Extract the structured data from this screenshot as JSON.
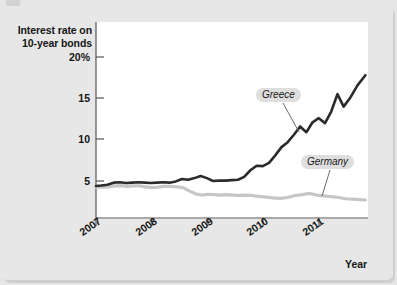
{
  "figure": {
    "background_color": "#e7e7e7",
    "plot_background_color": "#ffffff"
  },
  "axis": {
    "y_title_line1": "Interest rate on",
    "y_title_line2": "10-year bonds",
    "x_title": "Year",
    "y_ticks": [
      "20%",
      "15",
      "10",
      "5"
    ],
    "x_ticks": [
      "2007",
      "2008",
      "2009",
      "2010",
      "2011"
    ]
  },
  "labels": {
    "greece": "Greece",
    "germany": "Germany"
  },
  "chart_data": {
    "type": "line",
    "title": "",
    "subtitle": "",
    "xlabel": "Year",
    "ylabel": "Interest rate on 10-year bonds",
    "xlim": [
      2007.0,
      2012.25
    ],
    "ylim": [
      0,
      21.5
    ],
    "ytick_values": [
      20,
      15,
      10,
      5
    ],
    "ytick_labels": [
      "20%",
      "15",
      "10",
      "5"
    ],
    "xtick_values": [
      2007,
      2008,
      2009,
      2010,
      2011
    ],
    "xtick_labels": [
      "2007",
      "2008",
      "2009",
      "2010",
      "2011"
    ],
    "grid": false,
    "legend_position": "inline-annotation",
    "colors": {
      "greece": "#2b2b2b",
      "germany": "#c6c6c6"
    },
    "annotations": [
      {
        "text": "Greece",
        "points_to_series": "Greece",
        "x": 2010.55,
        "y": 11.4
      },
      {
        "text": "Germany",
        "points_to_series": "Germany",
        "x": 2011.45,
        "y": 7.4
      }
    ],
    "series": [
      {
        "name": "Greece",
        "color": "#2b2b2b",
        "x": [
          2007.0,
          2007.1,
          2007.22,
          2007.34,
          2007.46,
          2007.58,
          2007.7,
          2007.82,
          2007.94,
          2008.06,
          2008.18,
          2008.3,
          2008.42,
          2008.54,
          2008.66,
          2008.78,
          2008.9,
          2009.02,
          2009.14,
          2009.26,
          2009.38,
          2009.5,
          2009.62,
          2009.74,
          2009.86,
          2009.98,
          2010.1,
          2010.22,
          2010.34,
          2010.46,
          2010.58,
          2010.7,
          2010.82,
          2010.94,
          2011.06,
          2011.18,
          2011.3,
          2011.42,
          2011.54,
          2011.66,
          2011.78,
          2011.9,
          2012.05,
          2012.2
        ],
        "y": [
          4.4,
          4.45,
          4.55,
          4.8,
          4.85,
          4.75,
          4.8,
          4.85,
          4.8,
          4.75,
          4.8,
          4.85,
          4.8,
          4.95,
          5.25,
          5.15,
          5.35,
          5.6,
          5.35,
          5.0,
          5.05,
          5.05,
          5.1,
          5.15,
          5.5,
          6.3,
          6.85,
          6.8,
          7.2,
          8.1,
          9.1,
          9.7,
          10.6,
          11.6,
          10.9,
          12.1,
          12.6,
          12.0,
          13.4,
          15.5,
          14.0,
          15.0,
          16.6,
          17.8
        ]
      },
      {
        "name": "Germany",
        "color": "#c6c6c6",
        "x": [
          2007.0,
          2007.12,
          2007.24,
          2007.36,
          2007.48,
          2007.6,
          2007.72,
          2007.84,
          2007.96,
          2008.08,
          2008.2,
          2008.32,
          2008.44,
          2008.56,
          2008.68,
          2008.8,
          2008.92,
          2009.04,
          2009.16,
          2009.28,
          2009.4,
          2009.52,
          2009.64,
          2009.76,
          2009.88,
          2010.0,
          2010.14,
          2010.28,
          2010.42,
          2010.56,
          2010.7,
          2010.84,
          2010.98,
          2011.12,
          2011.26,
          2011.4,
          2011.54,
          2011.68,
          2011.82,
          2011.96,
          2012.1,
          2012.2
        ],
        "y": [
          4.25,
          4.25,
          4.3,
          4.4,
          4.45,
          4.35,
          4.4,
          4.4,
          4.3,
          4.2,
          4.25,
          4.35,
          4.35,
          4.3,
          4.2,
          3.8,
          3.45,
          3.3,
          3.4,
          3.35,
          3.3,
          3.35,
          3.3,
          3.25,
          3.3,
          3.25,
          3.15,
          3.05,
          2.95,
          2.9,
          3.0,
          3.25,
          3.35,
          3.5,
          3.3,
          3.2,
          3.1,
          3.0,
          2.85,
          2.8,
          2.75,
          2.7
        ]
      }
    ]
  }
}
